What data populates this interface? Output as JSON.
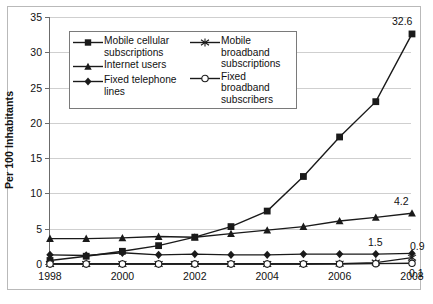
{
  "chart_data": {
    "type": "line",
    "title": "",
    "subtitle": "",
    "xlabel": "",
    "ylabel": "Per 100 Inhabitants",
    "x": [
      1998,
      1999,
      2000,
      2001,
      2002,
      2003,
      2004,
      2005,
      2006,
      2007,
      2008
    ],
    "xtick_labels": [
      "1998",
      "",
      "2000",
      "",
      "2002",
      "",
      "2004",
      "",
      "2006",
      "",
      "2008"
    ],
    "ytick_labels": [
      "0",
      "5",
      "10",
      "15",
      "20",
      "25",
      "30",
      "35"
    ],
    "xlim": [
      1998,
      2008
    ],
    "ylim": [
      0,
      35
    ],
    "ystep": 5,
    "grid": "horizontal",
    "legend_position": "upper-left-inside",
    "series": [
      {
        "name": "Mobile cellular subscriptions",
        "marker": "square",
        "values": [
          0.5,
          1.1,
          1.8,
          2.6,
          3.8,
          5.3,
          7.5,
          12.4,
          18.0,
          23.0,
          32.6
        ],
        "end_label": "32.6"
      },
      {
        "name": "Internet users",
        "marker": "triangle",
        "values": [
          3.6,
          3.6,
          3.7,
          3.9,
          3.8,
          4.3,
          4.8,
          5.3,
          6.1,
          6.6,
          7.2
        ],
        "end_label": "4.2"
      },
      {
        "name": "Fixed telephone lines",
        "marker": "diamond",
        "values": [
          1.3,
          1.2,
          1.6,
          1.3,
          1.4,
          1.3,
          1.3,
          1.4,
          1.4,
          1.4,
          1.5
        ],
        "end_label": "1.5"
      },
      {
        "name": "Mobile broadband subscriptions",
        "marker": "asterisk",
        "values": [
          0.0,
          0.0,
          0.0,
          0.0,
          0.0,
          0.0,
          0.0,
          0.0,
          0.05,
          0.2,
          0.9
        ],
        "end_label": "0.9"
      },
      {
        "name": "Fixed broadband subscribers",
        "marker": "circle-open",
        "values": [
          0.0,
          0.0,
          0.0,
          0.0,
          0.0,
          0.0,
          0.0,
          0.0,
          0.0,
          0.05,
          0.1
        ],
        "end_label": "0.1"
      }
    ],
    "annotations": [
      {
        "text": "32.6",
        "series": "Mobile cellular subscriptions"
      },
      {
        "text": "4.2",
        "series": "Internet users"
      },
      {
        "text": "1.5",
        "series": "Fixed telephone lines"
      },
      {
        "text": "0.9",
        "series": "Mobile broadband subscriptions"
      },
      {
        "text": "0.1",
        "series": "Fixed broadband subscribers"
      }
    ],
    "colors": {
      "line": "#1a1a1a",
      "grid": "#cfcfcf",
      "axis": "#6b6b6b",
      "background": "#ffffff",
      "text": "#111111"
    }
  },
  "legend": {
    "entries": [
      {
        "label_line1": "Mobile cellular",
        "label_line2": "subscriptions",
        "marker": "square"
      },
      {
        "label_line1": "Internet users",
        "label_line2": "",
        "marker": "triangle"
      },
      {
        "label_line1": "Fixed telephone",
        "label_line2": "lines",
        "marker": "diamond"
      },
      {
        "label_line1": "Mobile broadband",
        "label_line2": "subscriptions",
        "marker": "asterisk"
      },
      {
        "label_line1": "Fixed broadband",
        "label_line2": "subscribers",
        "marker": "circle-open"
      }
    ]
  },
  "axis": {
    "y_title": "Per 100 Inhabitants"
  }
}
